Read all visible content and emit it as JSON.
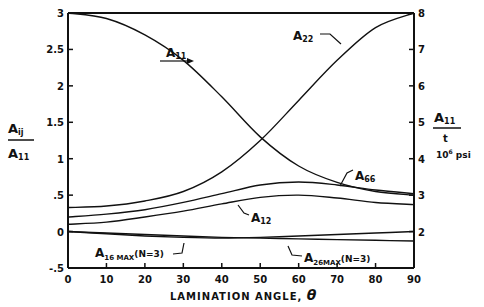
{
  "chart_data": {
    "type": "line",
    "title": "",
    "xlabel": "LAMINATION ANGLE, θ",
    "ylabel_left": "A_ij / A_11",
    "ylabel_right": "A_11 / t  (10^6 psi)",
    "xlim": [
      0,
      90
    ],
    "ylim_left": [
      -0.5,
      3
    ],
    "ylim_right": [
      1,
      8
    ],
    "x_ticks": [
      0,
      10,
      20,
      30,
      40,
      50,
      60,
      70,
      80,
      90
    ],
    "y_ticks_left": [
      "-.5",
      "0",
      ".5",
      "1",
      "1.5",
      "2",
      "2.5",
      "3"
    ],
    "y_ticks_right": [
      "2",
      "3",
      "4",
      "5",
      "6",
      "7",
      "8"
    ],
    "grid": false,
    "x": [
      0,
      10,
      20,
      30,
      40,
      50,
      60,
      70,
      80,
      90
    ],
    "series": [
      {
        "name": "A11",
        "axis": "right",
        "values": [
          8.0,
          7.85,
          7.4,
          6.7,
          5.7,
          4.6,
          3.8,
          3.35,
          3.1,
          3.0
        ]
      },
      {
        "name": "A22",
        "axis": "left",
        "values": [
          0.33,
          0.35,
          0.42,
          0.55,
          0.82,
          1.25,
          1.8,
          2.35,
          2.8,
          3.0
        ]
      },
      {
        "name": "A66",
        "axis": "left",
        "values": [
          0.2,
          0.24,
          0.3,
          0.4,
          0.52,
          0.64,
          0.68,
          0.64,
          0.57,
          0.52
        ]
      },
      {
        "name": "A12",
        "axis": "left",
        "values": [
          0.1,
          0.13,
          0.2,
          0.28,
          0.38,
          0.47,
          0.5,
          0.46,
          0.4,
          0.37
        ]
      },
      {
        "name": "A16 MAX (N=3)",
        "axis": "left",
        "values": [
          0.0,
          -0.02,
          -0.04,
          -0.06,
          -0.08,
          -0.09,
          -0.1,
          -0.11,
          -0.12,
          -0.13
        ]
      },
      {
        "name": "A26 MAX (N=3)",
        "axis": "left",
        "values": [
          0.0,
          -0.03,
          -0.06,
          -0.08,
          -0.09,
          -0.08,
          -0.06,
          -0.04,
          -0.02,
          0.0
        ]
      }
    ],
    "annotations": [
      "A11",
      "A22",
      "A66",
      "A12",
      "A16 MAX(N=3)",
      "A26 MAX(N=3)"
    ]
  },
  "labels": {
    "left_num": "A",
    "left_num_sub": "ij",
    "left_den": "A",
    "left_den_sub": "11",
    "right_num": "A",
    "right_num_sub": "11",
    "right_den": "t",
    "right_unit": "10",
    "right_unit_sup": "6",
    "right_unit_text": " psi",
    "xlabel": "LAMINATION ANGLE, ",
    "xlabel_theta": "θ",
    "a11": "A",
    "a11_sub": "11",
    "a22": "A",
    "a22_sub": "22",
    "a66": "A",
    "a66_sub": "66",
    "a12": "A",
    "a12_sub": "12",
    "a16": "A",
    "a16_sub": "16 MAX",
    "a16_tail": "(N=3)",
    "a26": "A",
    "a26_sub": "26MAX",
    "a26_tail": "(N=3)"
  }
}
